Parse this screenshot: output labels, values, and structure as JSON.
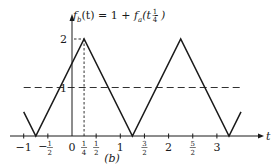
{
  "chart_data": {
    "type": "line",
    "title_parts": {
      "lhs": "f",
      "lhs_sub": "b",
      "lhs_arg": "(t)",
      "eq": "= 1 +",
      "rhs": "f",
      "rhs_sub": "a",
      "rhs_arg_open": "(t -",
      "rhs_frac_num": "1",
      "rhs_frac_den": "4",
      "rhs_arg_close": ")"
    },
    "xlabel": "t",
    "ylabel": "f_b(t)",
    "caption": "(b)",
    "xlim": [
      -1.25,
      4.0
    ],
    "ylim": [
      0,
      2.2
    ],
    "grid": false,
    "x_ticks": [
      {
        "value": -1,
        "label": "−1"
      },
      {
        "value": -0.5,
        "num": "1",
        "den": "2",
        "neg": true
      },
      {
        "value": 0,
        "label": "0"
      },
      {
        "value": 0.25,
        "num": "1",
        "den": "4"
      },
      {
        "value": 0.5,
        "num": "1",
        "den": "2"
      },
      {
        "value": 1,
        "label": "1"
      },
      {
        "value": 1.5,
        "num": "3",
        "den": "2"
      },
      {
        "value": 2,
        "label": "2"
      },
      {
        "value": 2.5,
        "num": "5",
        "den": "2"
      },
      {
        "value": 3,
        "label": "3"
      }
    ],
    "y_ticks": [
      {
        "value": 1,
        "label": "1"
      },
      {
        "value": 2,
        "label": "2"
      }
    ],
    "series": [
      {
        "name": "f_b(t)",
        "style": "solid",
        "x": [
          -1.0,
          -0.75,
          0.25,
          1.25,
          2.25,
          3.25,
          3.5
        ],
        "y": [
          0.5,
          0,
          2,
          0,
          2,
          0,
          0.5
        ]
      }
    ],
    "reference_lines": [
      {
        "type": "horizontal",
        "y": 1,
        "style": "dashed",
        "x_from": -1.0,
        "x_to": 3.5
      },
      {
        "type": "vertical",
        "x": 0.25,
        "style": "dashed",
        "y_from": 0,
        "y_to": 2
      },
      {
        "type": "horizontal",
        "y": 2,
        "style": "dashed",
        "x_from": 0,
        "x_to": 0.25
      }
    ],
    "annotations": [
      "Triangle wave with period 2, peaks of 2 at t = 1/4 + 2n, zeros at t = -3/4 + 2n, mean level 1 (dashed)"
    ]
  }
}
